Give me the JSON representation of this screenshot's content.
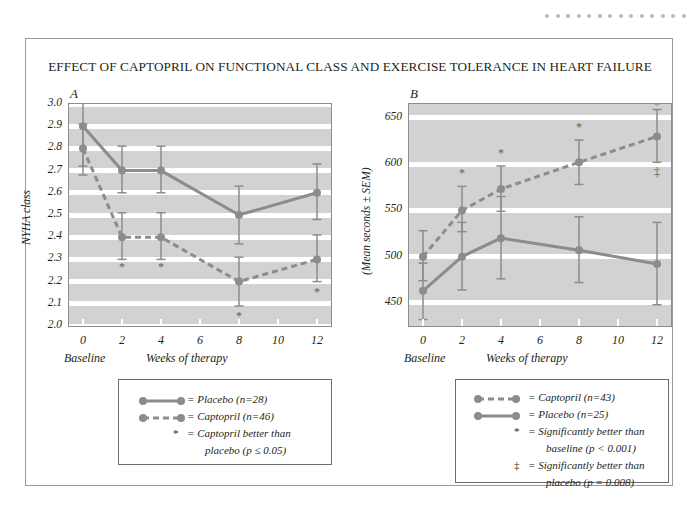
{
  "figure": {
    "title": "EFFECT OF CAPTOPRIL ON FUNCTIONAL CLASS AND EXERCISE TOLERANCE IN HEART FAILURE",
    "decor_dot_count": 14,
    "decor_dot_color": "#b9b9b9",
    "series_color": "#8c8c8c",
    "panel_bg": "#d2d2d2",
    "band_color": "#ffffff"
  },
  "chart_data": [
    {
      "type": "line",
      "panel_label": "A",
      "title": "",
      "xlabel": "Weeks of therapy",
      "ylabel": "NYHA class",
      "baseline_label": "Baseline",
      "x": [
        0,
        2,
        4,
        8,
        12
      ],
      "xticks": [
        0,
        2,
        4,
        6,
        8,
        10,
        12
      ],
      "xtick_labels": [
        "0",
        "2",
        "4",
        "6",
        "8",
        "10",
        "12"
      ],
      "xlim": [
        0,
        12
      ],
      "ylim": [
        2.0,
        3.0
      ],
      "yticks": [
        2.0,
        2.1,
        2.2,
        2.3,
        2.4,
        2.5,
        2.6,
        2.7,
        2.8,
        2.9,
        3.0
      ],
      "ytick_labels": [
        "2.0",
        "2.1",
        "2.2",
        "2.3",
        "2.4",
        "2.5",
        "2.6",
        "2.7",
        "2.8",
        "2.9",
        "3.0"
      ],
      "grid": true,
      "series": [
        {
          "name": "Placebo",
          "style": "solid",
          "values": [
            2.9,
            2.7,
            2.7,
            2.5,
            2.6
          ],
          "err_low": [
            2.72,
            2.6,
            2.6,
            2.37,
            2.48
          ],
          "err_high": [
            3.02,
            2.81,
            2.81,
            2.63,
            2.73
          ]
        },
        {
          "name": "Captopril",
          "style": "dashed",
          "values": [
            2.8,
            2.4,
            2.4,
            2.2,
            2.3
          ],
          "err_low": [
            2.68,
            2.3,
            2.3,
            2.09,
            2.2
          ],
          "err_high": [
            2.91,
            2.51,
            2.51,
            2.31,
            2.41
          ]
        }
      ],
      "annotations": [
        {
          "symbol": "*",
          "x": 2,
          "y": 2.26,
          "place": "below"
        },
        {
          "symbol": "*",
          "x": 4,
          "y": 2.26,
          "place": "below"
        },
        {
          "symbol": "*",
          "x": 8,
          "y": 2.04,
          "place": "below"
        },
        {
          "symbol": "*",
          "x": 12,
          "y": 2.15,
          "place": "below"
        }
      ],
      "legend": {
        "position": "below",
        "entries": [
          {
            "key": "solid",
            "text": "= Placebo (n=28)"
          },
          {
            "key": "dashed",
            "text": "= Captopril (n=46)"
          },
          {
            "key": "asterisk",
            "text": "= Captopril better than"
          },
          {
            "key": "none",
            "text": "placebo (p ≤ 0.05)"
          }
        ]
      }
    },
    {
      "type": "line",
      "panel_label": "B",
      "title": "",
      "xlabel": "Weeks of therapy",
      "ylabel": "(Mean seconds ± SEM)",
      "baseline_label": "Baseline",
      "x": [
        0,
        2,
        4,
        8,
        12
      ],
      "xticks": [
        0,
        2,
        4,
        6,
        8,
        10,
        12
      ],
      "xtick_labels": [
        "0",
        "2",
        "4",
        "6",
        "8",
        "10",
        "12"
      ],
      "xlim": [
        0,
        12
      ],
      "ylim": [
        425,
        665
      ],
      "yticks": [
        450,
        500,
        550,
        600,
        650
      ],
      "ytick_labels": [
        "450",
        "500",
        "550",
        "600",
        "650"
      ],
      "grid": true,
      "series": [
        {
          "name": "Captopril",
          "style": "dashed",
          "values": [
            500,
            550,
            573,
            602,
            630
          ],
          "err_low": [
            474,
            527,
            549,
            578,
            602
          ],
          "err_high": [
            528,
            576,
            598,
            626,
            659
          ]
        },
        {
          "name": "Placebo",
          "style": "solid",
          "values": [
            463,
            500,
            520,
            507,
            492
          ],
          "err_low": [
            432,
            464,
            476,
            472,
            448
          ],
          "err_high": [
            493,
            537,
            565,
            543,
            537
          ]
        }
      ],
      "annotations": [
        {
          "symbol": "*",
          "x": 2,
          "y": 589,
          "place": "above"
        },
        {
          "symbol": "*",
          "x": 4,
          "y": 611,
          "place": "above"
        },
        {
          "symbol": "*",
          "x": 8,
          "y": 639,
          "place": "above"
        },
        {
          "symbol": "*",
          "x": 12,
          "y": 663,
          "place": "above"
        },
        {
          "symbol": "‡",
          "x": 12,
          "y": 590,
          "place": "below"
        }
      ],
      "legend": {
        "position": "below",
        "entries": [
          {
            "key": "dashed",
            "text": "= Captopril (n=43)"
          },
          {
            "key": "solid",
            "text": "= Placebo (n=25)"
          },
          {
            "key": "asterisk",
            "text": "= Significantly better than"
          },
          {
            "key": "none",
            "text": "baseline (p < 0.001)"
          },
          {
            "key": "ddagger",
            "text": "= Significantly better than"
          },
          {
            "key": "none",
            "text": "placebo (p = 0.008)"
          }
        ]
      }
    }
  ]
}
